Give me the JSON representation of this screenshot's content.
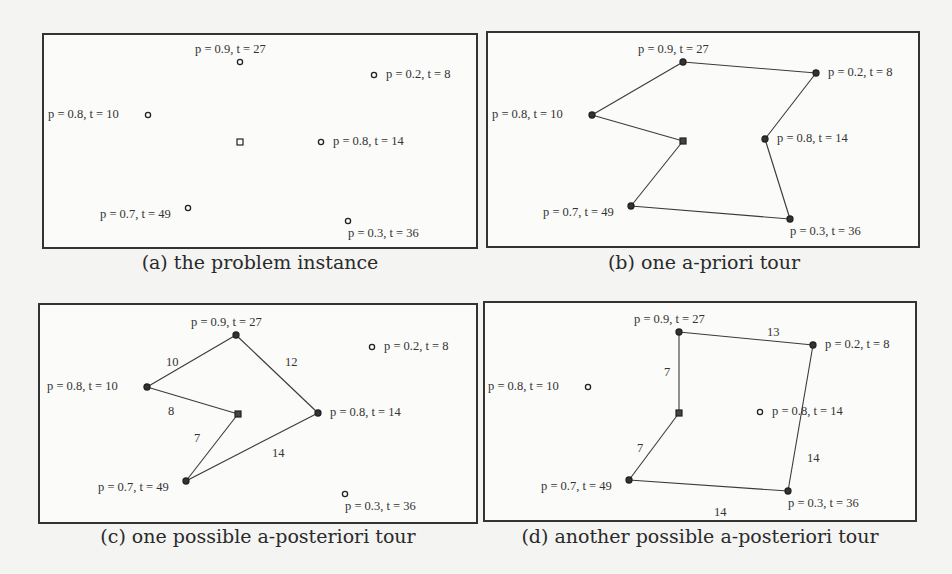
{
  "figure": {
    "panels": [
      {
        "id": "a",
        "caption": "(a) the problem instance",
        "tour_type": "none",
        "nodes": [
          {
            "id": "n27",
            "label": "p = 0.9, t = 27",
            "x": 240,
            "y": 62
          },
          {
            "id": "n8",
            "label": "p = 0.2, t = 8",
            "x": 374,
            "y": 75
          },
          {
            "id": "n10",
            "label": "p = 0.8, t = 10",
            "x": 148,
            "y": 115
          },
          {
            "id": "depot",
            "label": "",
            "x": 240,
            "y": 142
          },
          {
            "id": "n14",
            "label": "p = 0.8, t = 14",
            "x": 321,
            "y": 142
          },
          {
            "id": "n49",
            "label": "p = 0.7, t = 49",
            "x": 188,
            "y": 208
          },
          {
            "id": "n36",
            "label": "p = 0.3, t = 36",
            "x": 348,
            "y": 221
          }
        ],
        "edges": []
      },
      {
        "id": "b",
        "caption": "(b) one a-priori tour",
        "tour_type": "a-priori",
        "nodes": [
          {
            "id": "n27",
            "label": "p = 0.9, t = 27",
            "x": 683,
            "y": 62
          },
          {
            "id": "n8",
            "label": "p = 0.2, t = 8",
            "x": 816,
            "y": 73
          },
          {
            "id": "n10",
            "label": "p = 0.8, t = 10",
            "x": 592,
            "y": 115
          },
          {
            "id": "depot",
            "label": "",
            "x": 683,
            "y": 141
          },
          {
            "id": "n14",
            "label": "p = 0.8, t = 14",
            "x": 765,
            "y": 139
          },
          {
            "id": "n49",
            "label": "p = 0.7, t = 49",
            "x": 631,
            "y": 206
          },
          {
            "id": "n36",
            "label": "p = 0.3, t = 36",
            "x": 790,
            "y": 219
          }
        ],
        "edges": [
          {
            "from": "depot",
            "to": "n10",
            "weight": ""
          },
          {
            "from": "n10",
            "to": "n27",
            "weight": ""
          },
          {
            "from": "n27",
            "to": "n8",
            "weight": ""
          },
          {
            "from": "n8",
            "to": "n14",
            "weight": ""
          },
          {
            "from": "n14",
            "to": "n36",
            "weight": ""
          },
          {
            "from": "n36",
            "to": "n49",
            "weight": ""
          },
          {
            "from": "n49",
            "to": "depot",
            "weight": ""
          }
        ]
      },
      {
        "id": "c",
        "caption": "(c) one possible a-posteriori tour",
        "tour_type": "a-posteriori",
        "nodes": [
          {
            "id": "n27",
            "label": "p = 0.9, t = 27",
            "x": 236,
            "y": 335
          },
          {
            "id": "n8",
            "label": "p = 0.2, t = 8",
            "x": 372,
            "y": 347
          },
          {
            "id": "n10",
            "label": "p = 0.8, t = 10",
            "x": 147,
            "y": 387
          },
          {
            "id": "depot",
            "label": "",
            "x": 238,
            "y": 414
          },
          {
            "id": "n14",
            "label": "p = 0.8, t = 14",
            "x": 318,
            "y": 413
          },
          {
            "id": "n49",
            "label": "p = 0.7, t = 49",
            "x": 186,
            "y": 481
          },
          {
            "id": "n36",
            "label": "p = 0.3, t = 36",
            "x": 345,
            "y": 494
          }
        ],
        "visited": [
          "depot",
          "n10",
          "n27",
          "n14",
          "n49"
        ],
        "edges": [
          {
            "from": "depot",
            "to": "n10",
            "weight": "8",
            "lx": 168,
            "ly": 404
          },
          {
            "from": "n10",
            "to": "n27",
            "weight": "10",
            "lx": 166,
            "ly": 355
          },
          {
            "from": "n27",
            "to": "n14",
            "weight": "12",
            "lx": 285,
            "ly": 355
          },
          {
            "from": "n14",
            "to": "n49",
            "weight": "14",
            "lx": 272,
            "ly": 446
          },
          {
            "from": "n49",
            "to": "depot",
            "weight": "7",
            "lx": 194,
            "ly": 431
          }
        ]
      },
      {
        "id": "d",
        "caption": "(d) another possible a-posteriori tour",
        "tour_type": "a-posteriori",
        "nodes": [
          {
            "id": "n27",
            "label": "p = 0.9, t = 27",
            "x": 679,
            "y": 332
          },
          {
            "id": "n8",
            "label": "p = 0.2, t = 8",
            "x": 813,
            "y": 345
          },
          {
            "id": "n10",
            "label": "p = 0.8, t = 10",
            "x": 588,
            "y": 387
          },
          {
            "id": "depot",
            "label": "",
            "x": 679,
            "y": 413
          },
          {
            "id": "n14",
            "label": "p = 0.8, t = 14",
            "x": 760,
            "y": 412
          },
          {
            "id": "n49",
            "label": "p = 0.7, t = 49",
            "x": 629,
            "y": 480
          },
          {
            "id": "n36",
            "label": "p = 0.3, t = 36",
            "x": 788,
            "y": 491
          }
        ],
        "visited": [
          "depot",
          "n27",
          "n8",
          "n36",
          "n49"
        ],
        "edges": [
          {
            "from": "depot",
            "to": "n27",
            "weight": "7",
            "lx": 664,
            "ly": 365
          },
          {
            "from": "n27",
            "to": "n8",
            "weight": "13",
            "lx": 767,
            "ly": 325
          },
          {
            "from": "n8",
            "to": "n36",
            "weight": "14",
            "lx": 807,
            "ly": 451
          },
          {
            "from": "n36",
            "to": "n49",
            "weight": "14",
            "lx": 714,
            "ly": 505
          },
          {
            "from": "n49",
            "to": "depot",
            "weight": "7",
            "lx": 637,
            "ly": 441
          }
        ]
      }
    ]
  }
}
